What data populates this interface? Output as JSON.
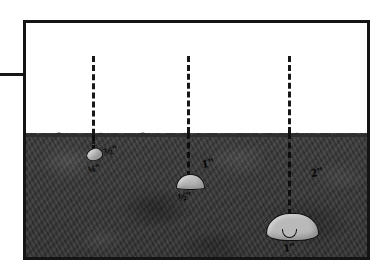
{
  "figure": {
    "title": "",
    "soil_color": "#3a3a3a",
    "stone_color": "#b9b9b9",
    "frame_color": "#141414",
    "background_color": "#ffffff"
  },
  "left_tick": {
    "name": "ground-reference-line"
  },
  "ground": {
    "label": ""
  },
  "measurements": [
    {
      "id": "shallow",
      "depth_label": "½\"",
      "size_label": "¼\"",
      "stone": "small-oval"
    },
    {
      "id": "medium",
      "depth_label": "1\"",
      "size_label": "½\"",
      "stone": "medium-dome"
    },
    {
      "id": "deep",
      "depth_label": "2\"",
      "size_label": "1\"",
      "stone": "large-kidney"
    }
  ]
}
